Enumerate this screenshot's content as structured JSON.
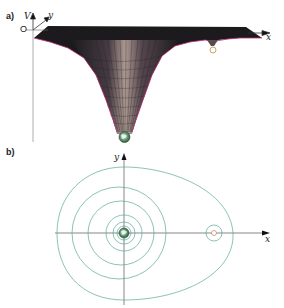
{
  "panels": {
    "a": {
      "label": "a)",
      "axes": {
        "vertical": "V",
        "depth": "y",
        "horizontal": "x",
        "origin": "O"
      },
      "description": "Gravitational potential surface V(x,y): deep well at Earth, shallow dip at Moon",
      "bodies": [
        {
          "name": "Earth",
          "icon": "earth-icon",
          "position": "bottom of deep well"
        },
        {
          "name": "Moon",
          "icon": "moon-icon",
          "position": "small dip near right edge"
        }
      ]
    },
    "b": {
      "label": "b)",
      "axes": {
        "vertical": "y",
        "horizontal": "x"
      },
      "description": "Equipotential contour lines in the x-y plane",
      "earth_contours": 6,
      "moon_contours": 1,
      "outer_contour": "egg-shaped line enclosing Earth and Moon"
    }
  },
  "colors": {
    "surface_dark": "#1a1a1a",
    "surface_rim": "#c0307a",
    "surface_mesh": "#6b5a66",
    "contour": "#5aa89a",
    "axis": "#333333",
    "earth_green": "#3d7f4a",
    "earth_blue": "#d8e8f0",
    "moon": "#c8a060"
  }
}
